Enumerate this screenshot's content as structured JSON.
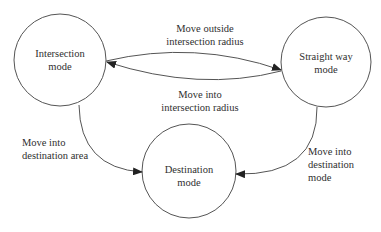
{
  "diagram": {
    "type": "state-diagram",
    "nodes": [
      {
        "id": "intersection",
        "line1": "Intersection",
        "line2": "mode"
      },
      {
        "id": "straight",
        "line1": "Straight way",
        "line2": "mode"
      },
      {
        "id": "destination",
        "line1": "Destination",
        "line2": "mode"
      }
    ],
    "edges": [
      {
        "from": "intersection",
        "to": "straight",
        "line1": "Move outside",
        "line2": "intersection radius"
      },
      {
        "from": "straight",
        "to": "intersection",
        "line1": "Move into",
        "line2": "intersection radius"
      },
      {
        "from": "intersection",
        "to": "destination",
        "line1": "Move into",
        "line2": "destination area"
      },
      {
        "from": "straight",
        "to": "destination",
        "line1": "Move into",
        "line2": "destination",
        "line3": "mode"
      }
    ],
    "colors": {
      "stroke": "#555555",
      "text": "#2f2f2f",
      "background": "#ffffff"
    }
  }
}
